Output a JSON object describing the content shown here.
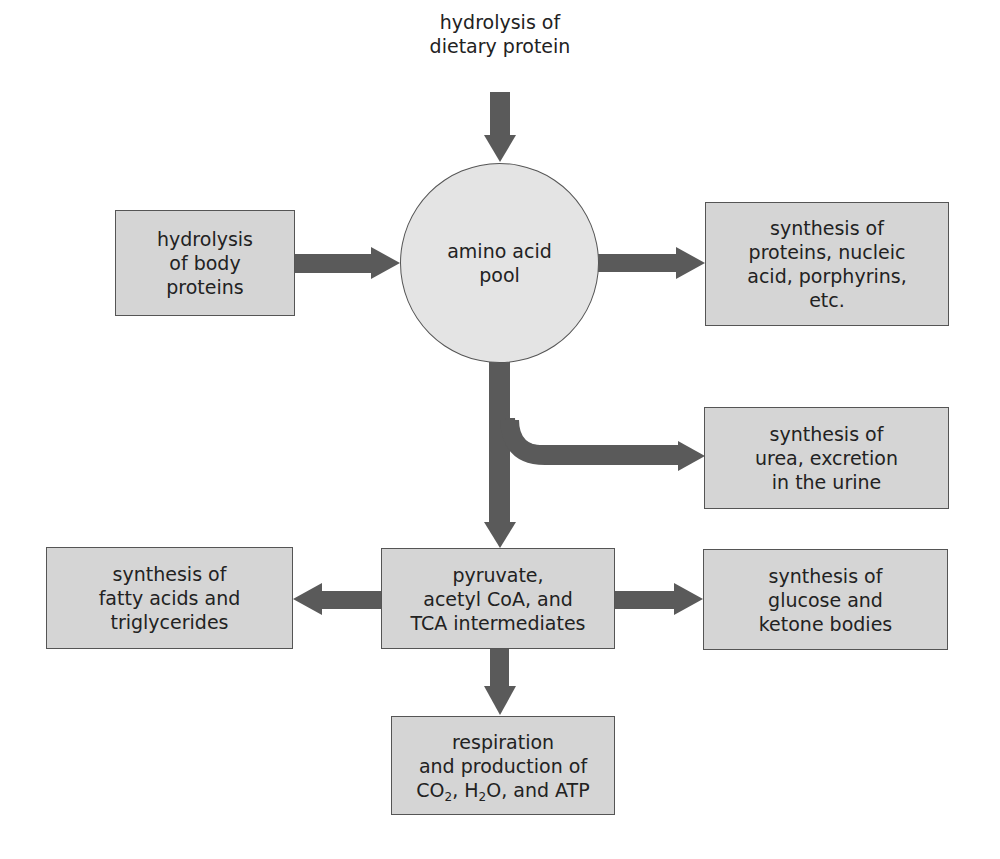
{
  "diagram": {
    "colors": {
      "box_fill": "#d5d5d5",
      "pool_fill": "#e4e4e4",
      "arrow": "#5a5a5a",
      "border": "#555555",
      "text": "#222222"
    },
    "source_top": {
      "line1": "hydrolysis of",
      "line2": "dietary protein"
    },
    "source_left": {
      "line1": "hydrolysis",
      "line2": "of body",
      "line3": "proteins"
    },
    "pool": {
      "line1": "amino acid",
      "line2": "pool"
    },
    "synthesis_proteins": {
      "line1": "synthesis of",
      "line2": "proteins, nucleic",
      "line3": "acid, porphyrins,",
      "line4": "etc."
    },
    "urea": {
      "line1": "synthesis of",
      "line2": "urea, excretion",
      "line3": "in the urine"
    },
    "intermediates": {
      "line1": "pyruvate,",
      "line2": "acetyl CoA, and",
      "line3": "TCA intermediates"
    },
    "fatty_acids": {
      "line1": "synthesis of",
      "line2": "fatty acids and",
      "line3": "triglycerides"
    },
    "glucose": {
      "line1": "synthesis of",
      "line2": "glucose and",
      "line3": "ketone bodies"
    },
    "respiration": {
      "line1": "respiration",
      "line2": "and production of",
      "line3_co": "CO",
      "line3_sub1": "2",
      "line3_mid": ", H",
      "line3_sub2": "2",
      "line3_end": "O, and ATP"
    },
    "edges": [
      {
        "from": "hydrolysis of dietary protein",
        "to": "amino acid pool"
      },
      {
        "from": "hydrolysis of body proteins",
        "to": "amino acid pool"
      },
      {
        "from": "amino acid pool",
        "to": "synthesis of proteins, nucleic acid, porphyrins, etc."
      },
      {
        "from": "amino acid pool",
        "to": "synthesis of urea, excretion in the urine"
      },
      {
        "from": "amino acid pool",
        "to": "pyruvate, acetyl CoA, and TCA intermediates"
      },
      {
        "from": "pyruvate, acetyl CoA, and TCA intermediates",
        "to": "synthesis of fatty acids and triglycerides"
      },
      {
        "from": "pyruvate, acetyl CoA, and TCA intermediates",
        "to": "synthesis of glucose and ketone bodies"
      },
      {
        "from": "pyruvate, acetyl CoA, and TCA intermediates",
        "to": "respiration and production of CO2, H2O, and ATP"
      }
    ]
  }
}
